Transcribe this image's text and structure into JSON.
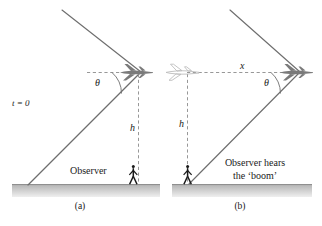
{
  "figure": {
    "colors": {
      "line": "#6e6e6e",
      "dashed": "#8c8c8c",
      "ground_top": "#b9b9b9",
      "ground_bottom": "#e8e8e8",
      "plane_solid": "#7a7a7a",
      "plane_ghost": "#c2c2c2",
      "observer": "#1a1a1a",
      "text": "#1a1a1a"
    },
    "panels": [
      {
        "id": "a",
        "caption": "(a)",
        "time_label": "t = 0",
        "angle_label": "θ",
        "height_label": "h",
        "observer_label": "Observer",
        "icons": {
          "plane": "airplane-icon",
          "observer": "standing-person-icon"
        }
      },
      {
        "id": "b",
        "caption": "(b)",
        "distance_label": "x",
        "angle_label": "θ",
        "height_label": "h",
        "observer_label_line1": "Observer hears",
        "observer_label_line2": "the ‘boom’",
        "icons": {
          "plane": "airplane-icon",
          "plane_past": "airplane-ghost-icon",
          "observer": "standing-person-icon"
        }
      }
    ]
  }
}
